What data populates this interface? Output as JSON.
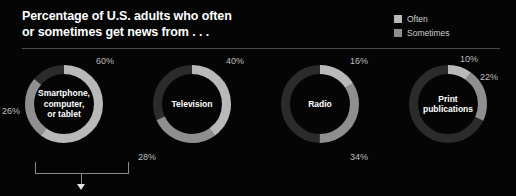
{
  "header": {
    "title_line1": "Percentage of U.S. adults who often",
    "title_line2": "or sometimes get news from . . ."
  },
  "legend": {
    "items": [
      {
        "label": "Often",
        "color": "#b9b9b9"
      },
      {
        "label": "Sometimes",
        "color": "#8f8f8f"
      }
    ]
  },
  "colors": {
    "background": "#050505",
    "often": "#b9b9b9",
    "sometimes": "#8f8f8f",
    "remainder": "#2b2b2b",
    "divider": "#4a4a4a",
    "title_text": "#ffffff",
    "pct_text": "#bdbdbd",
    "bracket": "#8a8a8a"
  },
  "chart_data": {
    "type": "pie",
    "title": "Percentage of U.S. adults who often or sometimes get news from . . .",
    "subtitle": "",
    "xlabel": "",
    "ylabel": "",
    "legend_position": "top-right",
    "series": [
      {
        "name": "Often",
        "values": [
          60,
          40,
          16,
          10
        ]
      },
      {
        "name": "Sometimes",
        "values": [
          26,
          28,
          34,
          22
        ]
      }
    ],
    "categories": [
      "Smartphone, computer, or tablet",
      "Television",
      "Radio",
      "Print publications"
    ],
    "charts": [
      {
        "name": "Smartphone, computer, or tablet",
        "label_line1": "Smartphone,",
        "label_line2": "computer,",
        "label_line3": "or tablet",
        "often": 60,
        "sometimes": 26,
        "often_label": "60%",
        "sometimes_label": "26%",
        "often_label_pos": {
          "left": 96,
          "top": 2
        },
        "sometimes_label_pos": {
          "left": 2,
          "top": 52
        }
      },
      {
        "name": "Television",
        "label_line1": "Television",
        "label_line2": "",
        "label_line3": "",
        "often": 40,
        "sometimes": 28,
        "often_label": "40%",
        "sometimes_label": "28%",
        "often_label_pos": {
          "left": 98,
          "top": 2
        },
        "sometimes_label_pos": {
          "left": 10,
          "top": 98
        }
      },
      {
        "name": "Radio",
        "label_line1": "Radio",
        "label_line2": "",
        "label_line3": "",
        "often": 16,
        "sometimes": 34,
        "often_label": "16%",
        "sometimes_label": "34%",
        "often_label_pos": {
          "left": 94,
          "top": 2
        },
        "sometimes_label_pos": {
          "left": 94,
          "top": 98
        }
      },
      {
        "name": "Print publications",
        "label_line1": "Print",
        "label_line2": "publications",
        "label_line3": "",
        "often": 10,
        "sometimes": 22,
        "often_label": "10%",
        "sometimes_label": "22%",
        "often_label_pos": {
          "left": 76,
          "top": 0
        },
        "sometimes_label_pos": {
          "left": 96,
          "top": 18
        }
      }
    ]
  }
}
